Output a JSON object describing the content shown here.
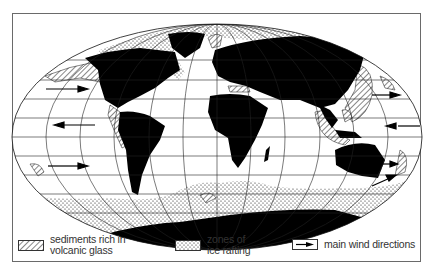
{
  "map": {
    "projection": "elliptical equal-area world map",
    "colors": {
      "land": "#000000",
      "ocean": "#ffffff",
      "graticule": "#222222",
      "frame": "#6a6a6a",
      "text": "#333333"
    },
    "layers": [
      {
        "name": "continents",
        "style": "solid black"
      },
      {
        "name": "volcanic-glass-sediments",
        "style": "diagonal hatching"
      },
      {
        "name": "ice-rafting-zones",
        "style": "dot stipple"
      },
      {
        "name": "wind-directions",
        "style": "arrows"
      }
    ],
    "wind_arrows": [
      {
        "side": "west",
        "direction": "east",
        "lat_band": "northern westerlies"
      },
      {
        "side": "west",
        "direction": "west",
        "lat_band": "trade winds"
      },
      {
        "side": "west",
        "direction": "east",
        "lat_band": "southern westerlies"
      },
      {
        "side": "east",
        "direction": "east",
        "lat_band": "northern westerlies"
      },
      {
        "side": "east",
        "direction": "west",
        "lat_band": "trade winds"
      },
      {
        "side": "east",
        "direction": "east",
        "lat_band": "southern westerlies"
      },
      {
        "side": "east",
        "direction": "northeast",
        "lat_band": "southern westerlies (New Zealand)"
      }
    ]
  },
  "legend": {
    "items": [
      {
        "symbol": "hatched-box",
        "line1": "sediments rich in",
        "line2": "volcanic glass"
      },
      {
        "symbol": "dotted-box",
        "line1": "zones of",
        "line2": "ice rafting"
      },
      {
        "symbol": "arrow-box",
        "line1": "main wind directions",
        "line2": ""
      }
    ]
  }
}
